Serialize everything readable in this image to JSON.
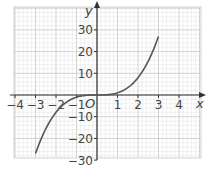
{
  "chart_data": {
    "type": "line",
    "title": "",
    "function": "y = x^3",
    "xlabel": "x",
    "ylabel": "y",
    "origin_label": "O",
    "xlim": [
      -4.5,
      4.5
    ],
    "ylim": [
      -30,
      35
    ],
    "x_ticks": [
      -4,
      -3,
      -2,
      -1,
      1,
      2,
      3,
      4
    ],
    "x_tick_labels": [
      "−4",
      "−3",
      "−2",
      "−1",
      "1",
      "2",
      "3",
      "4"
    ],
    "y_ticks": [
      -30,
      -20,
      -10,
      10,
      20,
      30
    ],
    "y_tick_labels": [
      "−30",
      "−20",
      "−10",
      "10",
      "20",
      "30"
    ],
    "grid": true,
    "series": [
      {
        "name": "y = x^3",
        "x": [
          -3,
          -2.5,
          -2,
          -1.5,
          -1,
          -0.5,
          0,
          0.5,
          1,
          1.5,
          2,
          2.5,
          3
        ],
        "y": [
          -27,
          -15.6,
          -8,
          -3.4,
          -1,
          -0.1,
          0,
          0.1,
          1,
          3.4,
          8,
          15.6,
          27
        ]
      }
    ],
    "colors": {
      "curve": "#555555",
      "axis": "#333333",
      "grid_major": "#c8c8c8",
      "grid_minor": "#e6e6e6"
    }
  }
}
